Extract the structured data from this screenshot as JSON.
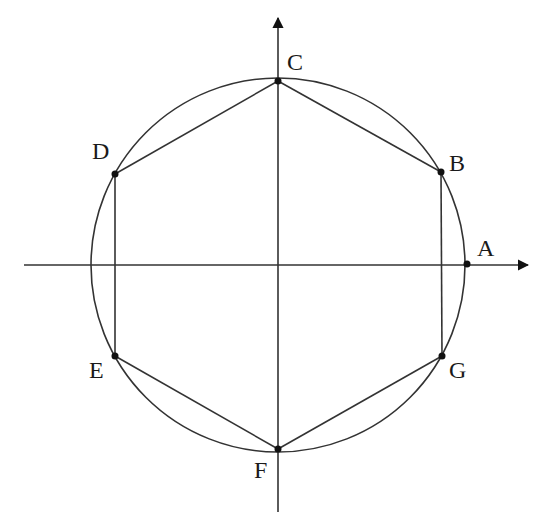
{
  "diagram": {
    "type": "geometry",
    "colors": {
      "stroke": "#333333",
      "point": "#111111",
      "background": "#ffffff"
    },
    "circle": {
      "cx": 278,
      "cy": 265,
      "r": 187
    },
    "axes": {
      "x": {
        "x1": 24,
        "y1": 265,
        "x2": 528,
        "y2": 265
      },
      "y": {
        "x1": 278,
        "y1": 512,
        "x2": 278,
        "y2": 18
      }
    },
    "points": [
      {
        "name": "A",
        "x": 467,
        "y": 264,
        "label_x": 477,
        "label_y": 256
      },
      {
        "name": "B",
        "x": 441,
        "y": 172,
        "label_x": 449,
        "label_y": 171
      },
      {
        "name": "C",
        "x": 278,
        "y": 81,
        "label_x": 287,
        "label_y": 70
      },
      {
        "name": "D",
        "x": 115,
        "y": 174,
        "label_x": 92,
        "label_y": 159
      },
      {
        "name": "E",
        "x": 115,
        "y": 356,
        "label_x": 89,
        "label_y": 378
      },
      {
        "name": "F",
        "x": 278,
        "y": 449,
        "label_x": 254,
        "label_y": 478
      },
      {
        "name": "G",
        "x": 442,
        "y": 356,
        "label_x": 449,
        "label_y": 378
      }
    ],
    "segments": [
      [
        "C",
        "B"
      ],
      [
        "B",
        "G"
      ],
      [
        "G",
        "F"
      ],
      [
        "F",
        "E"
      ],
      [
        "E",
        "D"
      ],
      [
        "D",
        "C"
      ]
    ]
  }
}
